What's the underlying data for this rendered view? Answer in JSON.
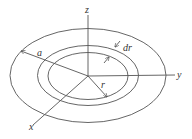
{
  "diagram": {
    "type": "disk-geometry",
    "labels": {
      "z": "z",
      "y": "y",
      "x": "x",
      "a": "a",
      "r": "r",
      "dr": "dr"
    },
    "center": [
      88,
      76
    ],
    "ellipses": [
      {
        "name": "outer-disk-edge",
        "rx": 78,
        "ry": 47,
        "meaning": "radius a"
      },
      {
        "name": "annulus-outer-edge",
        "rx": 50.5,
        "ry": 30,
        "meaning": "radius r + dr"
      },
      {
        "name": "annulus-inner-edge",
        "rx": 40,
        "ry": 23.5,
        "meaning": "radius r"
      }
    ],
    "colors": {
      "line": "#555555",
      "text": "#333333",
      "background": "#ffffff"
    }
  }
}
